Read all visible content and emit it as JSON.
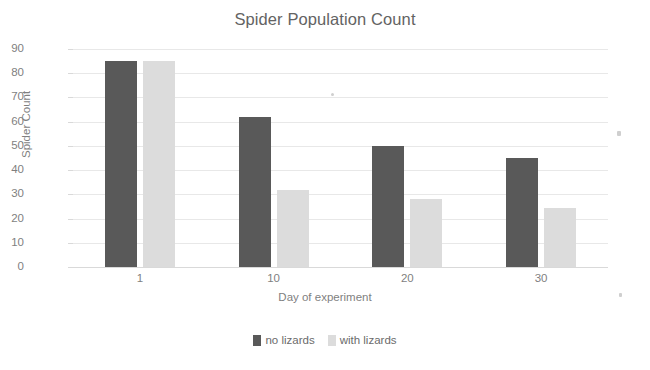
{
  "chart": {
    "title": "Spider Population Count",
    "xlabel": "Day of experiment",
    "ylabel": "Spider Count"
  },
  "legend": {
    "entries": [
      {
        "label": "no lizards",
        "color": "#595959"
      },
      {
        "label": "with lizards",
        "color": "#dcdcdc"
      }
    ]
  },
  "axis": {
    "y_ticks": [
      "0",
      "10",
      "20",
      "30",
      "40",
      "50",
      "60",
      "70",
      "80",
      "90"
    ],
    "x_ticks": [
      "1",
      "10",
      "20",
      "30"
    ]
  },
  "chart_data": {
    "type": "bar",
    "title": "Spider Population Count",
    "xlabel": "Day of experiment",
    "ylabel": "Spider Count",
    "categories": [
      "1",
      "10",
      "20",
      "30"
    ],
    "series": [
      {
        "name": "no lizards",
        "color": "#595959",
        "values": [
          85,
          62,
          50,
          45
        ]
      },
      {
        "name": "with lizards",
        "color": "#dcdcdc",
        "values": [
          85,
          32,
          28,
          24.5
        ]
      }
    ],
    "ylim": [
      0,
      90
    ],
    "ytick_step": 10,
    "grid": "horizontal",
    "legend_position": "bottom"
  }
}
